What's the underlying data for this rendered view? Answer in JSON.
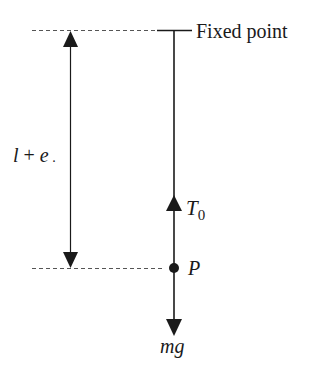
{
  "diagram": {
    "type": "physics-free-body",
    "labels": {
      "fixed_point": "Fixed point",
      "length_var1": "l",
      "length_op": " + ",
      "length_var2": "e",
      "length_trailing": " .",
      "tension_symbol": "T",
      "tension_subscript": "0",
      "particle": "P",
      "weight": "mg"
    },
    "elements": {
      "fixed_point_bar": {
        "x1": 157,
        "x2": 192,
        "y": 30
      },
      "string": {
        "x": 174,
        "y_top": 30,
        "y_bottom": 268
      },
      "particle_dot": {
        "cx": 174,
        "cy": 268,
        "r": 5
      },
      "tension_arrow": {
        "direction": "up",
        "tip_y": 196,
        "base_y": 211
      },
      "weight_arrow": {
        "direction": "down",
        "from_y": 268,
        "tip_y": 335
      },
      "dimension_arrow": {
        "x": 70,
        "y_top": 30,
        "y_bottom": 268,
        "label": "l + e"
      },
      "dashed_top": {
        "x1": 32,
        "x2": 155,
        "y": 30
      },
      "dashed_bottom": {
        "x1": 32,
        "x2": 165,
        "y": 268
      }
    },
    "colors": {
      "stroke": "#1a1a1a",
      "dashed": "#555555",
      "background": "#ffffff"
    }
  }
}
